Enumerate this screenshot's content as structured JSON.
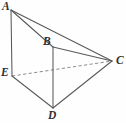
{
  "figure": {
    "name": "solid-geometry-figure",
    "canvas": {
      "width": 126,
      "height": 123
    },
    "background_color": "#fefefe",
    "stroke_color": "#58585a",
    "hidden_stroke_color": "#8d8d90",
    "label_color": "#2f2f31",
    "vertices": [
      {
        "id": "A",
        "label": "A",
        "x": 11,
        "y": 10,
        "label_x": 2,
        "label_y": 1
      },
      {
        "id": "B",
        "label": "B",
        "x": 53,
        "y": 47,
        "label_x": 43,
        "label_y": 36
      },
      {
        "id": "C",
        "label": "C",
        "x": 112,
        "y": 61,
        "label_x": 116,
        "label_y": 55
      },
      {
        "id": "D",
        "label": "D",
        "x": 53,
        "y": 108,
        "label_x": 48,
        "label_y": 110
      },
      {
        "id": "E",
        "label": "E",
        "x": 12,
        "y": 76,
        "label_x": 1,
        "label_y": 67
      }
    ],
    "edges": [
      {
        "id": "AB",
        "from": "A",
        "to": "B",
        "style": "solid",
        "path": "M 11 10 L 53 47"
      },
      {
        "id": "AC",
        "from": "A",
        "to": "C",
        "style": "solid",
        "path": "M 11 10 L 112 61"
      },
      {
        "id": "AE",
        "from": "A",
        "to": "E",
        "style": "solid",
        "path": "M 11 10 L 12 76"
      },
      {
        "id": "BC",
        "from": "B",
        "to": "C",
        "style": "solid",
        "path": "M 53 47 L 112 61"
      },
      {
        "id": "BD",
        "from": "B",
        "to": "D",
        "style": "solid",
        "path": "M 53 47 L 53 108"
      },
      {
        "id": "ED",
        "from": "E",
        "to": "D",
        "style": "solid",
        "path": "M 12 76 L 53 108"
      },
      {
        "id": "DC",
        "from": "D",
        "to": "C",
        "style": "solid",
        "path": "M 53 108 L 112 61"
      },
      {
        "id": "EC",
        "from": "E",
        "to": "C",
        "style": "dashed",
        "path": "M 12 76 L 112 61"
      }
    ]
  }
}
